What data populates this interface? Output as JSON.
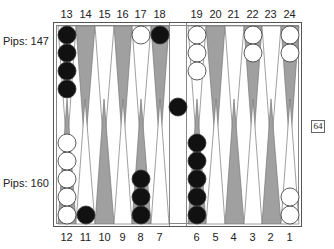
{
  "game": "Backgammon",
  "top_point_labels": [
    "13",
    "14",
    "15",
    "16",
    "17",
    "18",
    "19",
    "20",
    "21",
    "22",
    "23",
    "24"
  ],
  "bottom_point_labels": [
    "12",
    "11",
    "10",
    "9",
    "8",
    "7",
    "6",
    "5",
    "4",
    "3",
    "2",
    "1"
  ],
  "pips_top": "Pips: 147",
  "pips_bottom": "Pips: 160",
  "doubling_cube": "64",
  "colors": {
    "dark_point": "#a0a0a0",
    "light_point": "#ffffff",
    "black_checker": "#111111",
    "white_checker": "#ffffff"
  },
  "position": {
    "black": {
      "13": 4,
      "18": 1,
      "8": 3,
      "6": 5,
      "11": 1,
      "bar": 1
    },
    "white": {
      "17": 1,
      "19": 3,
      "22": 2,
      "24": 2,
      "12": 5,
      "1": 2
    }
  }
}
